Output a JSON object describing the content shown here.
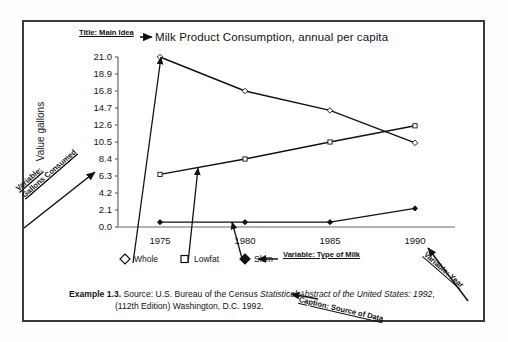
{
  "chart_data": {
    "type": "line",
    "title": "Milk Product Consumption, annual per capita",
    "xlabel": "",
    "ylabel": "Value gallons",
    "categories": [
      "1975",
      "1980",
      "1985",
      "1990"
    ],
    "x": [
      1975,
      1980,
      1985,
      1990
    ],
    "ylim": [
      0.0,
      21.0
    ],
    "yticks": [
      "0.0",
      "2.1",
      "4.2",
      "6.3",
      "8.4",
      "10.5",
      "12.6",
      "14.7",
      "16.8",
      "18.9",
      "21.0"
    ],
    "ytick_values": [
      0.0,
      2.1,
      4.2,
      6.3,
      8.4,
      10.5,
      12.6,
      14.7,
      16.8,
      18.9,
      21.0
    ],
    "grid": false,
    "legend_position": "bottom-left",
    "series": [
      {
        "name": "Whole",
        "marker": "open-diamond",
        "values": [
          21.0,
          16.8,
          14.4,
          10.4
        ]
      },
      {
        "name": "Lowfat",
        "marker": "open-square",
        "values": [
          6.5,
          8.4,
          10.5,
          12.5
        ]
      },
      {
        "name": "Skim",
        "marker": "filled-diamond",
        "values": [
          0.6,
          0.6,
          0.6,
          2.3
        ]
      }
    ]
  },
  "annotations": {
    "title_label": "Title: Main Idea",
    "y_variable_label_line1": "Variable:",
    "y_variable_label_line2": "Gallons Consumed",
    "series_variable_label": "Variable: Type of Milk",
    "x_variable_label": "Variable: Year",
    "caption_label": "Caption: Source of Data"
  },
  "caption": {
    "example": "Example 1.3.",
    "line1_prefix": " Source: U.S. Bureau of the Census ",
    "line1_italic": "Statistical Abstract of the United States: 1992",
    "line1_suffix": ",",
    "line2": "(112th Edition) Washington, D.C. 1992."
  },
  "legend": {
    "items": [
      {
        "label": "Whole",
        "marker": "open-diamond"
      },
      {
        "label": "Lowfat",
        "marker": "open-square"
      },
      {
        "label": "Skim",
        "marker": "filled-diamond"
      }
    ]
  }
}
